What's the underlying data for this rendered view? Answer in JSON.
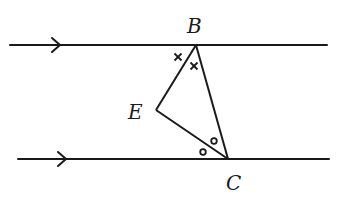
{
  "diagram": {
    "type": "geometry",
    "colors": {
      "stroke": "#1a1a1a",
      "background": "#ffffff"
    },
    "parallel_lines": [
      {
        "id": "upper",
        "x1": 10,
        "y": 45,
        "x2": 327,
        "arrow_x": 60,
        "arrow": "right"
      },
      {
        "id": "lower",
        "x1": 18,
        "y": 159,
        "x2": 329,
        "arrow_x": 66,
        "arrow": "right"
      }
    ],
    "points": {
      "B": {
        "label": "B",
        "x": 196,
        "y": 45,
        "label_x": 187,
        "label_y": 33
      },
      "E": {
        "label": "E",
        "x": 156,
        "y": 110,
        "label_x": 128,
        "label_y": 119
      },
      "C": {
        "label": "C",
        "x": 228,
        "y": 159,
        "label_x": 226,
        "label_y": 190
      }
    },
    "segments": [
      {
        "from": "B",
        "to": "E"
      },
      {
        "from": "E",
        "to": "C"
      },
      {
        "from": "B",
        "to": "C"
      }
    ],
    "angle_marks": {
      "cross": [
        {
          "x": 178,
          "y": 57
        },
        {
          "x": 194,
          "y": 66
        }
      ],
      "circle": [
        {
          "x": 203,
          "y": 152
        },
        {
          "x": 214,
          "y": 141
        }
      ]
    }
  }
}
